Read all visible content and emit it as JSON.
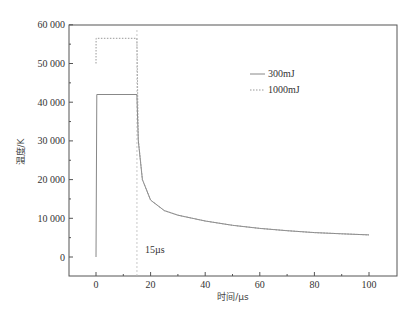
{
  "chart_data": {
    "type": "line",
    "title": "",
    "xlabel": "时间/µs",
    "ylabel": "温度/K",
    "xlim": [
      -10,
      110
    ],
    "ylim": [
      -5000,
      60000
    ],
    "xticks": [
      0,
      20,
      40,
      60,
      80,
      100
    ],
    "xtick_labels": [
      "0",
      "20",
      "40",
      "60",
      "80",
      "100"
    ],
    "yticks": [
      0,
      10000,
      20000,
      30000,
      40000,
      50000,
      60000
    ],
    "ytick_labels": [
      "0",
      "10 000",
      "20 000",
      "30 000",
      "40 000",
      "50 000",
      "60 000"
    ],
    "grid": false,
    "legend_position": "upper right",
    "series": [
      {
        "name": "300mJ",
        "style": "solid",
        "x": [
          0,
          0.3,
          15,
          15.5,
          17,
          20,
          25,
          30,
          40,
          50,
          60,
          70,
          80,
          90,
          100
        ],
        "y": [
          0,
          42000,
          42000,
          30000,
          20000,
          14700,
          12000,
          10800,
          9300,
          8200,
          7400,
          6800,
          6300,
          6000,
          5700
        ]
      },
      {
        "name": "1000mJ",
        "style": "dotted",
        "x": [
          0,
          0.05,
          15,
          15.5,
          17,
          20,
          25,
          30,
          40,
          50,
          60,
          70,
          80,
          90,
          100
        ],
        "y": [
          50000,
          56500,
          56500,
          30500,
          20000,
          14700,
          12000,
          10800,
          9300,
          8200,
          7400,
          6800,
          6300,
          6000,
          5700
        ]
      }
    ],
    "annotations": [
      {
        "text": "15µs",
        "x": 15,
        "note": "vertical dashed marker line at t = 15 µs"
      }
    ]
  },
  "legend": {
    "items": [
      {
        "label": "300mJ",
        "style": "solid"
      },
      {
        "label": "1000mJ",
        "style": "dotted"
      }
    ]
  },
  "axes": {
    "xlabel": "时间/µs",
    "ylabel": "温度/K"
  },
  "annotation_text": "15µs",
  "colors": {
    "axis": "#555555",
    "line": "#888888",
    "marker": "#bbbbbb"
  }
}
